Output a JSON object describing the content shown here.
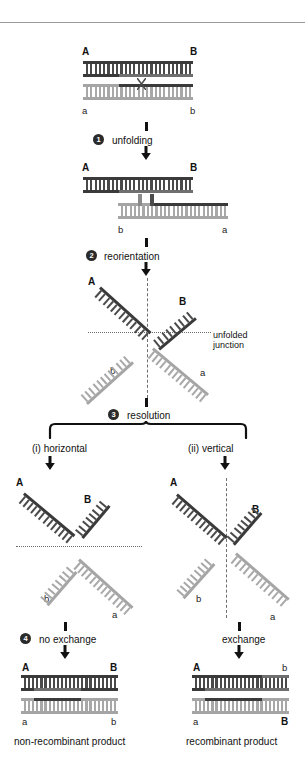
{
  "figure": {
    "title_rule": true,
    "labels": {
      "A": "A",
      "B": "B",
      "a": "a",
      "b": "b"
    },
    "steps": [
      {
        "num": "1",
        "label": "unfolding"
      },
      {
        "num": "2",
        "label": "reorientation"
      },
      {
        "num": "3",
        "label": "resolution"
      },
      {
        "num": "4",
        "label": "no exchange"
      }
    ],
    "branch": {
      "left_label": "(i)  horizontal",
      "right_label": "(ii)  vertical",
      "right_step_label": "exchange"
    },
    "annotations": {
      "unfolded_junction_line1": "unfolded",
      "unfolded_junction_line2": "junction"
    },
    "products": {
      "left_caption": "non-recombinant product",
      "right_caption": "recombinant product",
      "left_top_left": "A",
      "left_top_right": "B",
      "left_bot_left": "a",
      "left_bot_right": "b",
      "right_top_left": "A",
      "right_top_right": "b",
      "right_bot_left": "a",
      "right_bot_right": "B"
    },
    "panels": {
      "p1_top_left": "A",
      "p1_top_right": "B",
      "p1_bot_left": "a",
      "p1_bot_right": "b",
      "p2_top_left": "A",
      "p2_top_right": "B",
      "p2_bot_left": "b",
      "p2_bot_right": "a",
      "p3_A": "A",
      "p3_B": "B",
      "p3_b": "b",
      "p3_a": "a",
      "p4_A": "A",
      "p4_B": "B",
      "p4_b": "b",
      "p4_a": "a",
      "p5_A": "A",
      "p5_B": "B",
      "p5_b": "b",
      "p5_a": "a"
    },
    "colors": {
      "strand_dark": "#3a3a3a",
      "strand_light": "#a5a5a5",
      "rung_dark": "#4a4a4a",
      "rung_light": "#a8a8a8",
      "guide_line": "#6d6d6d",
      "text": "#111111",
      "step_badge": "#2b2b2b"
    }
  }
}
